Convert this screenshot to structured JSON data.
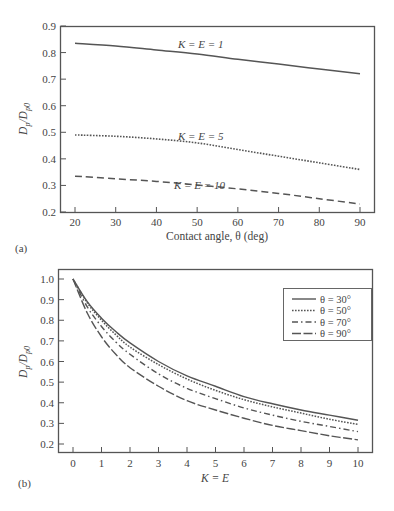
{
  "chart_data": [
    {
      "panel": "(a)",
      "type": "line",
      "title": "",
      "xlabel": "Contact angle, θ (deg)",
      "ylabel": "Dp/Dp0",
      "ylabel_main": "D",
      "ylabel_sub1": "p",
      "ylabel_den": "/D",
      "ylabel_sub2": "p0",
      "xlim": [
        20,
        90
      ],
      "ylim": [
        0.2,
        0.9
      ],
      "xticks": [
        20,
        30,
        40,
        50,
        60,
        70,
        80,
        90
      ],
      "xtick_labels": [
        "20",
        "30",
        "40",
        "50",
        "60",
        "70",
        "80",
        "90"
      ],
      "yticks": [
        0.2,
        0.3,
        0.4,
        0.5,
        0.6,
        0.7,
        0.8,
        0.9
      ],
      "ytick_labels": [
        "0.2",
        "0.3",
        "0.4",
        "0.5",
        "0.6",
        "0.7",
        "0.8",
        "0.9"
      ],
      "grid": false,
      "x": [
        20,
        30,
        40,
        50,
        60,
        70,
        80,
        90
      ],
      "series": [
        {
          "name": "K = E = 1",
          "style": "solid",
          "values": [
            0.835,
            0.825,
            0.81,
            0.795,
            0.775,
            0.757,
            0.738,
            0.72
          ]
        },
        {
          "name": "K = E = 5",
          "style": "dotted",
          "values": [
            0.49,
            0.485,
            0.475,
            0.46,
            0.435,
            0.41,
            0.385,
            0.36
          ]
        },
        {
          "name": "K = E = 10",
          "style": "dashed",
          "values": [
            0.335,
            0.325,
            0.315,
            0.302,
            0.287,
            0.27,
            0.25,
            0.23
          ]
        }
      ],
      "annotations": [
        {
          "text": "K = E = 1",
          "x": 57,
          "y": 0.837
        },
        {
          "text": "K = E = 5",
          "x": 57,
          "y": 0.5
        },
        {
          "text": "K = E = 10",
          "x": 57,
          "y": 0.34
        }
      ]
    },
    {
      "panel": "(b)",
      "type": "line",
      "title": "",
      "xlabel": "K = E",
      "ylabel": "Dp/Dp0",
      "ylabel_main": "D",
      "ylabel_sub1": "p",
      "ylabel_den": "/D",
      "ylabel_sub2": "p0",
      "xlim": [
        -0.5,
        10.5
      ],
      "ylim": [
        0.15,
        1.05
      ],
      "xticks": [
        0,
        1,
        2,
        3,
        4,
        5,
        6,
        7,
        8,
        9,
        10
      ],
      "xtick_labels": [
        "0",
        "1",
        "2",
        "3",
        "4",
        "5",
        "6",
        "7",
        "8",
        "9",
        "10"
      ],
      "yticks": [
        0.2,
        0.3,
        0.4,
        0.5,
        0.6,
        0.7,
        0.8,
        0.9,
        1.0
      ],
      "ytick_labels": [
        "0.2",
        "0.3",
        "0.4",
        "0.5",
        "0.6",
        "0.7",
        "0.8",
        "0.9",
        "1.0"
      ],
      "grid": false,
      "legend_position": "upper right",
      "x": [
        0,
        0.5,
        1,
        1.5,
        2,
        3,
        4,
        5,
        6,
        7,
        8,
        9,
        10
      ],
      "series": [
        {
          "name": "θ = 30°",
          "style": "solid",
          "values": [
            1.0,
            0.89,
            0.81,
            0.745,
            0.69,
            0.6,
            0.53,
            0.48,
            0.43,
            0.395,
            0.365,
            0.34,
            0.315
          ]
        },
        {
          "name": "θ = 50°",
          "style": "dotted",
          "values": [
            1.0,
            0.885,
            0.8,
            0.73,
            0.67,
            0.585,
            0.515,
            0.46,
            0.415,
            0.38,
            0.35,
            0.32,
            0.295
          ]
        },
        {
          "name": "θ = 70°",
          "style": "dash-dot",
          "values": [
            1.0,
            0.865,
            0.77,
            0.695,
            0.635,
            0.54,
            0.47,
            0.42,
            0.375,
            0.34,
            0.31,
            0.285,
            0.26
          ]
        },
        {
          "name": "θ = 90°",
          "style": "long-dash",
          "values": [
            1.0,
            0.835,
            0.72,
            0.635,
            0.57,
            0.48,
            0.41,
            0.365,
            0.325,
            0.29,
            0.265,
            0.24,
            0.22
          ]
        }
      ]
    }
  ],
  "colors": {
    "line": "#555555",
    "axis": "#555555",
    "text": "#444444",
    "background": "#ffffff"
  }
}
